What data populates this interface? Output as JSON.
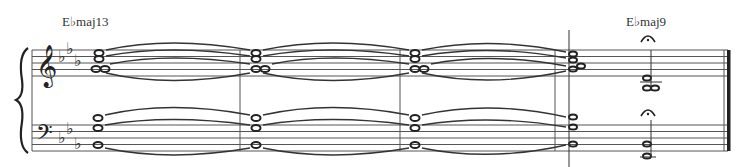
{
  "score": {
    "chord_symbols": [
      {
        "label": "E♭maj13",
        "x": 62
      },
      {
        "label": "E♭maj9",
        "x": 628
      }
    ],
    "key_signature": "E-flat major (3 flats)",
    "clefs": [
      "treble",
      "bass"
    ],
    "systems": 1,
    "measures": 5,
    "fermatas": 2,
    "ending": "final-barline"
  }
}
